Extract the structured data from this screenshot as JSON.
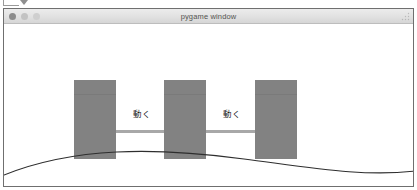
{
  "window": {
    "title": "pygame window",
    "controls": [
      {
        "name": "close",
        "color": "#8c8c8c"
      },
      {
        "name": "minimize",
        "color": "#c3c3c3"
      },
      {
        "name": "zoom",
        "color": "#cfcfcf"
      }
    ],
    "border_color": "#6f6f6f",
    "titlebar_color": "#e2e2e2",
    "background_color": "#ffffff"
  },
  "top_crop": {
    "icon": "chevron-down-icon"
  },
  "diagram": {
    "block_color": "#828282",
    "arrow_color": "#a8a8a8",
    "curve_color": "#2e2e2e",
    "blocks": [
      {
        "id": "block-1",
        "x": 70,
        "y": 56,
        "width": 42,
        "height": 79
      },
      {
        "id": "block-2",
        "x": 160,
        "y": 56,
        "width": 42,
        "height": 79
      },
      {
        "id": "block-3",
        "x": 251,
        "y": 56,
        "width": 42,
        "height": 79
      }
    ],
    "arrows": [
      {
        "id": "arrow-1",
        "label": "動く",
        "x": 108,
        "y": 99,
        "length": 66,
        "label_x": 129,
        "label_y": 85
      },
      {
        "id": "arrow-2",
        "label": "動く",
        "x": 199,
        "y": 99,
        "length": 66,
        "label_x": 219,
        "label_y": 85
      }
    ]
  }
}
